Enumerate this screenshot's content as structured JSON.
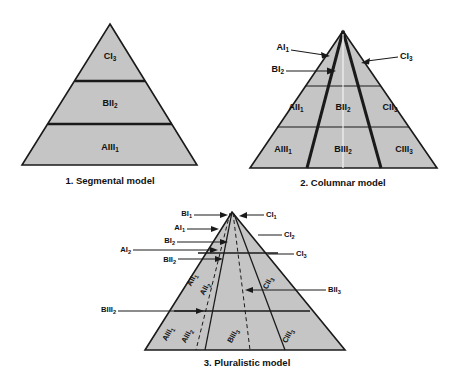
{
  "figure": {
    "title_implicit": "",
    "background_color": "#ffffff",
    "fill_color": "#c5c5c5",
    "line_color": "#1a1a1a"
  },
  "models": [
    {
      "caption": "1.  Segmental model",
      "caption_number": "1.",
      "caption_name": "Segmental model",
      "type": "segmental",
      "bands": [
        {
          "label_base": "CI",
          "label_sub": "3"
        },
        {
          "label_base": "BII",
          "label_sub": "2"
        },
        {
          "label_base": "AIII",
          "label_sub": "1"
        }
      ]
    },
    {
      "caption": "2.  Columnar model",
      "caption_number": "2.",
      "caption_name": "Columnar model",
      "type": "columnar",
      "callouts": [
        {
          "label_base": "AI",
          "label_sub": "1"
        },
        {
          "label_base": "CI",
          "label_sub": "3"
        },
        {
          "label_base": "BI",
          "label_sub": "2"
        }
      ],
      "cells_middle": [
        {
          "label_base": "AII",
          "label_sub": "1"
        },
        {
          "label_base": "BII",
          "label_sub": "2"
        },
        {
          "label_base": "CII",
          "label_sub": "3"
        }
      ],
      "cells_bottom": [
        {
          "label_base": "AIII",
          "label_sub": "1"
        },
        {
          "label_base": "BIII",
          "label_sub": "2"
        },
        {
          "label_base": "CIII",
          "label_sub": "3"
        }
      ]
    },
    {
      "caption": "3.  Pluralistic model",
      "caption_number": "3.",
      "caption_name": "Pluralistic model",
      "type": "pluralistic",
      "callouts_left": [
        {
          "label_base": "BI",
          "label_sub": "1"
        },
        {
          "label_base": "AI",
          "label_sub": "1"
        },
        {
          "label_base": "BI",
          "label_sub": "2"
        },
        {
          "label_base": "AI",
          "label_sub": "2"
        },
        {
          "label_base": "BII",
          "label_sub": "2"
        },
        {
          "label_base": "BIII",
          "label_sub": "2"
        }
      ],
      "callouts_right": [
        {
          "label_base": "CI",
          "label_sub": "1"
        },
        {
          "label_base": "CI",
          "label_sub": "2"
        },
        {
          "label_base": "CI",
          "label_sub": "3"
        },
        {
          "label_base": "BII",
          "label_sub": "3"
        }
      ],
      "interior_labels": [
        {
          "label_base": "AII",
          "label_sub": "1"
        },
        {
          "label_base": "AII",
          "label_sub": "2"
        },
        {
          "label_base": "CII",
          "label_sub": "3"
        },
        {
          "label_base": "AIII",
          "label_sub": "1"
        },
        {
          "label_base": "AIII",
          "label_sub": "2"
        },
        {
          "label_base": "BIII",
          "label_sub": "3"
        },
        {
          "label_base": "CIII",
          "label_sub": "3"
        }
      ]
    }
  ]
}
